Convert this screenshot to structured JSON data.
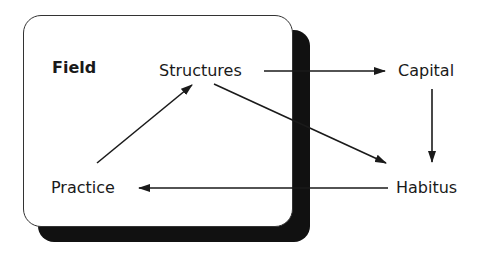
{
  "diagram": {
    "container": {
      "label": "Field"
    },
    "nodes": {
      "structures": "Structures",
      "capital": "Capital",
      "habitus": "Habitus",
      "practice": "Practice"
    },
    "edges": [
      {
        "from": "Structures",
        "to": "Capital"
      },
      {
        "from": "Capital",
        "to": "Habitus"
      },
      {
        "from": "Structures",
        "to": "Habitus"
      },
      {
        "from": "Habitus",
        "to": "Practice"
      },
      {
        "from": "Practice",
        "to": "Structures"
      }
    ],
    "colors": {
      "line": "#1a1a1a",
      "shadow": "#111111",
      "box": "#ffffff"
    }
  }
}
